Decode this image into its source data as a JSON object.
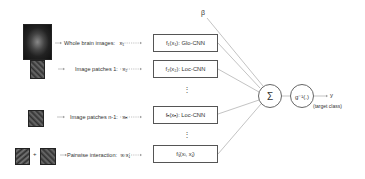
{
  "inputs": [
    {
      "label": "Whole brain images:",
      "var": "x₁"
    },
    {
      "label": "Image patches 1:",
      "var": "x₂"
    },
    {
      "label": "Image patches n-1:",
      "var": "xₙ"
    },
    {
      "label": "Pairwise interaction:",
      "var": "xᵢ xⱼ"
    }
  ],
  "plus": "+",
  "boxes": [
    {
      "label": "f₁(x₁): Glo-CNN"
    },
    {
      "label": "f₂(x₂): Loc-CNN"
    },
    {
      "label": "fₙ(xₙ): Loc-CNN"
    },
    {
      "label": "fᵢⱼ(xᵢ, xⱼ)"
    }
  ],
  "ellipsis": "⋮",
  "beta": "β",
  "sum": "Σ",
  "link": "g⁻¹(.)",
  "output": {
    "var": "y",
    "caption": "(target class)"
  },
  "colors": {
    "line": "#9a9a9a",
    "box_border": "#555555"
  }
}
